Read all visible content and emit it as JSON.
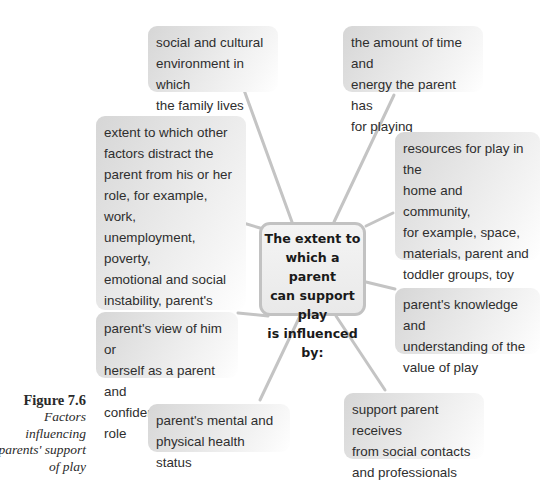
{
  "diagram": {
    "center": {
      "label": "The extent to\nwhich a parent\ncan support play\nis influenced by:"
    },
    "factors": [
      {
        "id": "social-cultural",
        "label": "social and cultural\nenvironment in which\nthe family lives"
      },
      {
        "id": "time-energy",
        "label": "the amount of time and\nenergy the parent has\nfor playing"
      },
      {
        "id": "distractions",
        "label": "extent to which other\nfactors distract the\nparent from his or her\nrole, for example, work,\nunemployment, poverty,\nemotional and social\ninstability, parent's own\nrelationships, other\ncaring roles"
      },
      {
        "id": "resources",
        "label": "resources for play in the\nhome and community,\nfor example, space,\nmaterials, parent and\ntoddler groups, toy\nlibraries"
      },
      {
        "id": "knowledge",
        "label": "parent's knowledge and\nunderstanding of the\nvalue of play"
      },
      {
        "id": "self-view",
        "label": "parent's view of him or\nherself as a parent and\nconfidence in this role"
      },
      {
        "id": "health",
        "label": "parent's mental and\nphysical health status"
      },
      {
        "id": "support",
        "label": "support parent receives\nfrom social contacts\nand professionals"
      }
    ],
    "connector_color": "#c4c4c4"
  },
  "caption": {
    "figure_label": "Figure 7.6",
    "description": "Factors\ninfluencing\nparents' support\nof play"
  }
}
